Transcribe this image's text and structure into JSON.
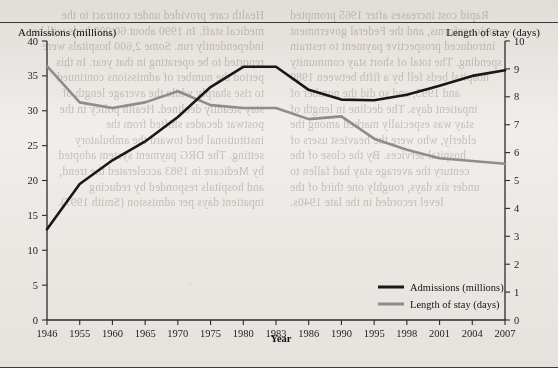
{
  "page": {
    "bleed_left": "Health care provided under contract to the\nmedical staff. In 1990 about 60,000 beds will be\nindependently run. Some 2,600 hospitals were\nreported to be operating in that year. In this\nperiod the number of admissions continued\nto rise sharply while the average length of\nstay steadily declined. Health policy in the\npostwar decades shifted from the\ninstitutional bed toward the ambulatory\nsetting. The DRG payment system adopted\nby Medicare in 1983 accelerated the trend,\nand hospitals responded by reducing\ninpatient days per admission (Smith 1997).",
    "bleed_right": "Rapid cost increases after 1965 prompted\nmajor reforms, and the Federal government\nintroduced prospective payment to restrain\nspending. The total of short stay community\nhospital beds fell by a fifth between 1980\nand 1995, and so did the number of\ninpatient days. The decline in length of\nstay was especially marked among the\nelderly, who were the heaviest users of\nhospital services. By the close of the\ncentury the average stay had fallen to\nunder six days, roughly one third of the\nlevel recorded in the late 1940s."
  },
  "chart_data": {
    "type": "line",
    "title": "",
    "xlabel": "Year",
    "ylabel": "Admissions (millions)",
    "y2label": "Length of stay (days)",
    "grid": false,
    "legend_position": "bottom-right",
    "categories": [
      "1946",
      "1955",
      "1960",
      "1965",
      "1970",
      "1975",
      "1980",
      "1983",
      "1986",
      "1990",
      "1995",
      "1998",
      "2001",
      "2004",
      "2007"
    ],
    "ylim": [
      0,
      40
    ],
    "ytick_step": 5,
    "yticks": [
      0,
      5,
      10,
      15,
      20,
      25,
      30,
      35,
      40
    ],
    "y2lim": [
      0,
      10
    ],
    "y2tick_step": 1,
    "y2ticks": [
      0,
      1,
      2,
      3,
      4,
      5,
      6,
      7,
      8,
      9,
      10
    ],
    "series": [
      {
        "name": "Admissions (millions)",
        "axis": "left",
        "color": "#181818",
        "values": [
          13.0,
          19.5,
          22.9,
          25.6,
          29.1,
          33.4,
          36.3,
          36.3,
          33.0,
          31.6,
          31.5,
          32.3,
          33.6,
          35.0,
          35.8
        ]
      },
      {
        "name": "Length of stay (days)",
        "axis": "right",
        "color": "#8d8d8d",
        "values": [
          9.1,
          7.8,
          7.6,
          7.8,
          8.2,
          7.7,
          7.6,
          7.6,
          7.2,
          7.3,
          6.5,
          6.1,
          5.8,
          5.7,
          5.6
        ]
      }
    ],
    "legend": [
      {
        "label": "Admissions (millions)",
        "color": "#181818"
      },
      {
        "label": "Length of stay (days)",
        "color": "#8d8d8d"
      }
    ]
  }
}
